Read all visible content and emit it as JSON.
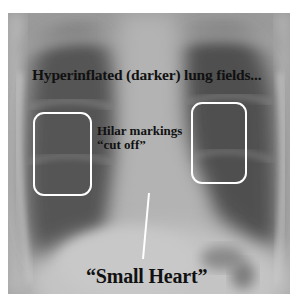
{
  "figure": {
    "type": "annotated chest x-ray",
    "annotations": {
      "title": "Hyperinflated (darker) lung fields...",
      "hilar_line1": "Hilar markings",
      "hilar_line2": "“cut off”",
      "heart": "“Small Heart”"
    },
    "colors": {
      "annotation_box": "#ffffff",
      "pointer_line": "#ffffff",
      "text": "#111111"
    }
  }
}
